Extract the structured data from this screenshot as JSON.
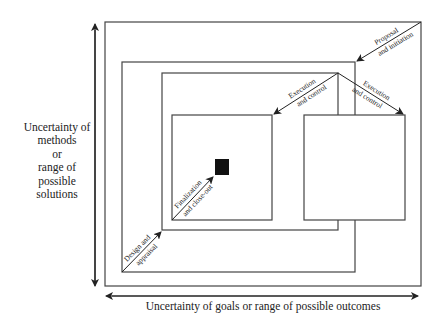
{
  "diagram": {
    "y_axis_label_lines": [
      "Uncertainty of",
      "methods",
      "or",
      "range of",
      "possible",
      "solutions"
    ],
    "x_axis_label": "Uncertainty of goals or range of possible outcomes",
    "phases": {
      "proposal": [
        "Proposal",
        "and initiation"
      ],
      "execution_left": [
        "Execution",
        "and control"
      ],
      "execution_right": [
        "Execution",
        "and control"
      ],
      "finalization": [
        "Finalization",
        "and close-out"
      ],
      "design": [
        "Design and",
        "appraisal"
      ]
    },
    "colors": {
      "line": "#333333",
      "text": "#222222",
      "fill_square": "#111111",
      "background": "#ffffff"
    }
  }
}
